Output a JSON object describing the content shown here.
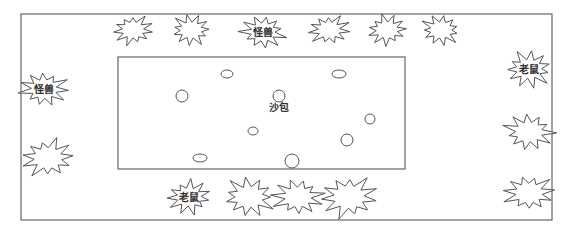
{
  "diagram": {
    "outer_area": {
      "x": 21,
      "y": 14,
      "w": 531,
      "h": 206
    },
    "inner_area": {
      "x": 118,
      "y": 57,
      "w": 287,
      "h": 112,
      "label": "沙包",
      "label_pos": {
        "x": 279,
        "y": 108
      }
    },
    "stars": [
      {
        "x": 133,
        "y": 30,
        "r": 17,
        "label": ""
      },
      {
        "x": 191,
        "y": 30,
        "r": 17,
        "label": ""
      },
      {
        "x": 263,
        "y": 32,
        "r": 19,
        "label": "怪兽"
      },
      {
        "x": 329,
        "y": 30,
        "r": 17,
        "label": ""
      },
      {
        "x": 387,
        "y": 30,
        "r": 17,
        "label": ""
      },
      {
        "x": 441,
        "y": 30,
        "r": 17,
        "label": ""
      },
      {
        "x": 44,
        "y": 89,
        "r": 20,
        "label": "怪兽"
      },
      {
        "x": 48,
        "y": 158,
        "r": 22,
        "label": ""
      },
      {
        "x": 529,
        "y": 69,
        "r": 20,
        "label": "老鼠"
      },
      {
        "x": 529,
        "y": 132,
        "r": 21,
        "label": "老鼠_blank"
      },
      {
        "x": 529,
        "y": 193,
        "r": 21,
        "label": ""
      },
      {
        "x": 189,
        "y": 197,
        "r": 19,
        "label": "老鼠"
      },
      {
        "x": 249,
        "y": 197,
        "r": 22,
        "label": ""
      },
      {
        "x": 298,
        "y": 197,
        "r": 21,
        "label": ""
      },
      {
        "x": 349,
        "y": 197,
        "r": 24,
        "label": ""
      }
    ],
    "circles": [
      {
        "cx": 227,
        "cy": 74,
        "rx": 6,
        "ry": 4
      },
      {
        "cx": 339,
        "cy": 74,
        "rx": 7,
        "ry": 4
      },
      {
        "cx": 182,
        "cy": 96,
        "rx": 6,
        "ry": 6
      },
      {
        "cx": 279,
        "cy": 96,
        "rx": 6,
        "ry": 6
      },
      {
        "cx": 370,
        "cy": 119,
        "rx": 5,
        "ry": 5
      },
      {
        "cx": 253,
        "cy": 131,
        "rx": 5,
        "ry": 4
      },
      {
        "cx": 347,
        "cy": 140,
        "rx": 6,
        "ry": 6
      },
      {
        "cx": 200,
        "cy": 158,
        "rx": 7,
        "ry": 4
      },
      {
        "cx": 292,
        "cy": 161,
        "rx": 7,
        "ry": 7
      }
    ]
  },
  "labels": {
    "sandbag": "沙包",
    "monster": "怪兽",
    "mouse": "老鼠"
  }
}
